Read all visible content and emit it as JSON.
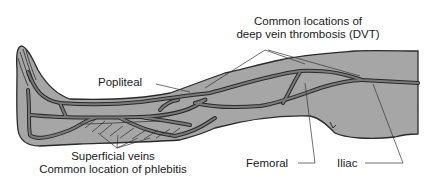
{
  "diagram": {
    "colors": {
      "skin_fill": "#a6a6a6",
      "outline": "#2a2a2a",
      "vein_fill": "#7a7a7a",
      "leader_line": "#333333",
      "text": "#1a1a1a",
      "background": "#ffffff"
    },
    "labels": {
      "dvt_line1": "Common locations of",
      "dvt_line2": "deep vein thrombosis (DVT)",
      "popliteal": "Popliteal",
      "superficial_line1": "Superficial veins",
      "superficial_line2": "Common location of phlebitis",
      "femoral": "Femoral",
      "iliac": "Iliac"
    }
  }
}
